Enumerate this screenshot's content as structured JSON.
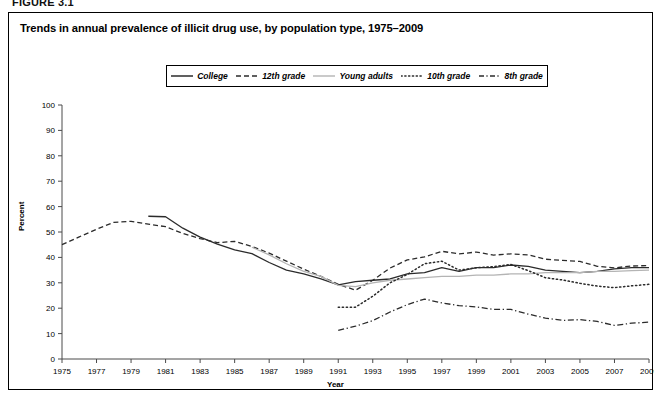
{
  "figure": {
    "label": "FIGURE 3.1",
    "title": "Trends in annual prevalence of illicit drug use, by population type, 1975–2009"
  },
  "axes": {
    "ylabel": "Percent",
    "xlabel": "Year",
    "yticks": [
      "0",
      "10",
      "20",
      "30",
      "40",
      "50",
      "60",
      "70",
      "80",
      "90",
      "100"
    ],
    "xticks": [
      "1975",
      "1977",
      "1979",
      "1981",
      "1983",
      "1985",
      "1987",
      "1989",
      "1991",
      "1993",
      "1995",
      "1997",
      "1999",
      "2001",
      "2003",
      "2005",
      "2007",
      "2009"
    ]
  },
  "legend": {
    "items": [
      {
        "label": "College",
        "style": "solid",
        "color": "#2b2b2b",
        "width": 1.4
      },
      {
        "label": "12th grade",
        "style": "dashed",
        "color": "#2b2b2b",
        "width": 1.3
      },
      {
        "label": "Young adults",
        "style": "solid-light",
        "color": "#b4b4b4",
        "width": 1.3
      },
      {
        "label": "10th grade",
        "style": "dotted",
        "color": "#2b2b2b",
        "width": 1.4
      },
      {
        "label": "8th grade",
        "style": "dashdot",
        "color": "#2b2b2b",
        "width": 1.3
      }
    ]
  },
  "chart_data": {
    "type": "line",
    "title": "Trends in annual prevalence of illicit drug use, by population type, 1975–2009",
    "xlabel": "Year",
    "ylabel": "Percent",
    "xlim": [
      1975,
      2009
    ],
    "ylim": [
      0,
      100
    ],
    "grid": false,
    "legend_position": "top-center",
    "x": [
      1975,
      1976,
      1977,
      1978,
      1979,
      1980,
      1981,
      1982,
      1983,
      1984,
      1985,
      1986,
      1987,
      1988,
      1989,
      1990,
      1991,
      1992,
      1993,
      1994,
      1995,
      1996,
      1997,
      1998,
      1999,
      2000,
      2001,
      2002,
      2003,
      2004,
      2005,
      2006,
      2007,
      2008,
      2009
    ],
    "series": [
      {
        "name": "College",
        "style": "solid",
        "color": "#2b2b2b",
        "x": [
          1980,
          1981,
          1982,
          1983,
          1984,
          1985,
          1986,
          1987,
          1988,
          1989,
          1990,
          1991,
          1992,
          1993,
          1994,
          1995,
          1996,
          1997,
          1998,
          1999,
          2000,
          2001,
          2002,
          2003,
          2004,
          2005,
          2006,
          2007,
          2008,
          2009
        ],
        "values": [
          56.2,
          56.0,
          51.5,
          48.0,
          45.2,
          43.0,
          41.5,
          38.0,
          35.0,
          33.5,
          31.5,
          29.2,
          30.5,
          31.0,
          31.5,
          33.5,
          34.0,
          36.0,
          34.5,
          36.0,
          36.0,
          37.0,
          36.5,
          35.0,
          34.5,
          34.0,
          34.5,
          35.5,
          36.0,
          36.0
        ]
      },
      {
        "name": "12th grade",
        "style": "dashed",
        "color": "#2b2b2b",
        "x": [
          1975,
          1976,
          1977,
          1978,
          1979,
          1980,
          1981,
          1982,
          1983,
          1984,
          1985,
          1986,
          1987,
          1988,
          1989,
          1990,
          1991,
          1992,
          1993,
          1994,
          1995,
          1996,
          1997,
          1998,
          1999,
          2000,
          2001,
          2002,
          2003,
          2004,
          2005,
          2006,
          2007,
          2008,
          2009
        ],
        "values": [
          45.0,
          48.1,
          51.1,
          53.8,
          54.2,
          53.1,
          52.1,
          49.4,
          47.4,
          45.8,
          46.3,
          44.3,
          41.7,
          38.5,
          35.4,
          32.5,
          29.4,
          27.1,
          31.0,
          35.8,
          39.0,
          40.2,
          42.4,
          41.4,
          42.1,
          40.9,
          41.4,
          41.0,
          39.3,
          38.8,
          38.4,
          36.5,
          35.9,
          36.6,
          36.8
        ]
      },
      {
        "name": "Young adults",
        "style": "solid-light",
        "color": "#b4b4b4",
        "x": [
          1986,
          1987,
          1988,
          1989,
          1990,
          1991,
          1992,
          1993,
          1994,
          1995,
          1996,
          1997,
          1998,
          1999,
          2000,
          2001,
          2002,
          2003,
          2004,
          2005,
          2006,
          2007,
          2008,
          2009
        ],
        "values": [
          44.0,
          41.0,
          37.5,
          34.5,
          32.5,
          29.0,
          28.5,
          30.0,
          31.0,
          31.5,
          32.0,
          32.5,
          32.5,
          33.0,
          33.0,
          33.5,
          33.5,
          34.0,
          34.0,
          34.0,
          34.5,
          34.5,
          34.8,
          35.0
        ]
      },
      {
        "name": "10th grade",
        "style": "dotted",
        "color": "#2b2b2b",
        "x": [
          1991,
          1992,
          1993,
          1994,
          1995,
          1996,
          1997,
          1998,
          1999,
          2000,
          2001,
          2002,
          2003,
          2004,
          2005,
          2006,
          2007,
          2008,
          2009
        ],
        "values": [
          20.4,
          20.4,
          24.7,
          30.0,
          33.3,
          37.5,
          38.5,
          35.0,
          35.9,
          36.4,
          37.2,
          34.8,
          32.0,
          31.1,
          29.8,
          28.7,
          28.1,
          28.8,
          29.4
        ]
      },
      {
        "name": "8th grade",
        "style": "dashdot",
        "color": "#2b2b2b",
        "x": [
          1991,
          1992,
          1993,
          1994,
          1995,
          1996,
          1997,
          1998,
          1999,
          2000,
          2001,
          2002,
          2003,
          2004,
          2005,
          2006,
          2007,
          2008,
          2009
        ],
        "values": [
          11.3,
          12.9,
          15.1,
          18.5,
          21.4,
          23.6,
          22.1,
          21.0,
          20.5,
          19.5,
          19.5,
          17.7,
          16.1,
          15.2,
          15.5,
          14.8,
          13.2,
          14.1,
          14.5
        ]
      }
    ]
  }
}
